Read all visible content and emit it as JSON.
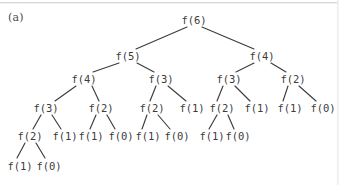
{
  "figure": {
    "panel_label": "(a)",
    "width": 339,
    "height": 185,
    "background_color": "#ffffff",
    "text_color": "#3c3c3c",
    "edge_color": "#3c3c3c"
  },
  "chart_data": {
    "type": "diagram",
    "diagram_kind": "recursion-tree",
    "title": "(a)",
    "root_label": "f(6)",
    "nodes": [
      {
        "id": "n0",
        "label": "f(6)",
        "level": 0,
        "x": 194,
        "y": 20
      },
      {
        "id": "n1",
        "label": "f(5)",
        "level": 1,
        "x": 128,
        "y": 56
      },
      {
        "id": "n2",
        "label": "f(4)",
        "level": 1,
        "x": 262,
        "y": 56
      },
      {
        "id": "n3",
        "label": "f(4)",
        "level": 2,
        "x": 84,
        "y": 79
      },
      {
        "id": "n4",
        "label": "f(3)",
        "level": 2,
        "x": 161,
        "y": 79
      },
      {
        "id": "n5",
        "label": "f(3)",
        "level": 2,
        "x": 229,
        "y": 79
      },
      {
        "id": "n6",
        "label": "f(2)",
        "level": 2,
        "x": 293,
        "y": 79
      },
      {
        "id": "n7",
        "label": "f(3)",
        "level": 3,
        "x": 46,
        "y": 108
      },
      {
        "id": "n8",
        "label": "f(2)",
        "level": 3,
        "x": 101,
        "y": 108
      },
      {
        "id": "n9",
        "label": "f(2)",
        "level": 3,
        "x": 152,
        "y": 108
      },
      {
        "id": "n10",
        "label": "f(1)",
        "level": 3,
        "x": 192,
        "y": 108
      },
      {
        "id": "n11",
        "label": "f(2)",
        "level": 3,
        "x": 222,
        "y": 108
      },
      {
        "id": "n12",
        "label": "f(1)",
        "level": 3,
        "x": 257,
        "y": 108
      },
      {
        "id": "n13",
        "label": "f(1)",
        "level": 3,
        "x": 290,
        "y": 108
      },
      {
        "id": "n14",
        "label": "f(0)",
        "level": 3,
        "x": 323,
        "y": 108
      },
      {
        "id": "n15",
        "label": "f(2)",
        "level": 4,
        "x": 30,
        "y": 136
      },
      {
        "id": "n16",
        "label": "f(1)",
        "level": 4,
        "x": 65,
        "y": 136
      },
      {
        "id": "n17",
        "label": "f(1)",
        "level": 4,
        "x": 91,
        "y": 136
      },
      {
        "id": "n18",
        "label": "f(0)",
        "level": 4,
        "x": 121,
        "y": 136
      },
      {
        "id": "n19",
        "label": "f(1)",
        "level": 4,
        "x": 148,
        "y": 136
      },
      {
        "id": "n20",
        "label": "f(0)",
        "level": 4,
        "x": 177,
        "y": 136
      },
      {
        "id": "n21",
        "label": "f(1)",
        "level": 4,
        "x": 212,
        "y": 136
      },
      {
        "id": "n22",
        "label": "f(0)",
        "level": 4,
        "x": 238,
        "y": 136
      },
      {
        "id": "n23",
        "label": "f(1)",
        "level": 5,
        "x": 20,
        "y": 166
      },
      {
        "id": "n24",
        "label": "f(0)",
        "level": 5,
        "x": 49,
        "y": 166
      }
    ],
    "edges": [
      {
        "from": "n0",
        "to": "n1",
        "x1": 187,
        "y1": 27,
        "x2": 136,
        "y2": 49
      },
      {
        "from": "n0",
        "to": "n2",
        "x1": 202,
        "y1": 27,
        "x2": 254,
        "y2": 49
      },
      {
        "from": "n1",
        "to": "n3",
        "x1": 119,
        "y1": 63,
        "x2": 93,
        "y2": 72
      },
      {
        "from": "n1",
        "to": "n4",
        "x1": 137,
        "y1": 63,
        "x2": 154,
        "y2": 72
      },
      {
        "from": "n2",
        "to": "n5",
        "x1": 254,
        "y1": 63,
        "x2": 236,
        "y2": 72
      },
      {
        "from": "n2",
        "to": "n6",
        "x1": 271,
        "y1": 63,
        "x2": 286,
        "y2": 72
      },
      {
        "from": "n3",
        "to": "n7",
        "x1": 76,
        "y1": 86,
        "x2": 55,
        "y2": 101
      },
      {
        "from": "n3",
        "to": "n8",
        "x1": 92,
        "y1": 86,
        "x2": 99,
        "y2": 101
      },
      {
        "from": "n4",
        "to": "n9",
        "x1": 156,
        "y1": 86,
        "x2": 150,
        "y2": 101
      },
      {
        "from": "n4",
        "to": "n10",
        "x1": 168,
        "y1": 86,
        "x2": 186,
        "y2": 101
      },
      {
        "from": "n5",
        "to": "n11",
        "x1": 223,
        "y1": 86,
        "x2": 217,
        "y2": 101
      },
      {
        "from": "n5",
        "to": "n12",
        "x1": 235,
        "y1": 86,
        "x2": 250,
        "y2": 101
      },
      {
        "from": "n6",
        "to": "n13",
        "x1": 288,
        "y1": 86,
        "x2": 283,
        "y2": 101
      },
      {
        "from": "n6",
        "to": "n14",
        "x1": 299,
        "y1": 86,
        "x2": 316,
        "y2": 101
      },
      {
        "from": "n7",
        "to": "n15",
        "x1": 41,
        "y1": 115,
        "x2": 33,
        "y2": 129
      },
      {
        "from": "n7",
        "to": "n16",
        "x1": 52,
        "y1": 115,
        "x2": 61,
        "y2": 129
      },
      {
        "from": "n8",
        "to": "n17",
        "x1": 96,
        "y1": 115,
        "x2": 90,
        "y2": 129
      },
      {
        "from": "n8",
        "to": "n18",
        "x1": 107,
        "y1": 115,
        "x2": 115,
        "y2": 129
      },
      {
        "from": "n9",
        "to": "n19",
        "x1": 147,
        "y1": 115,
        "x2": 142,
        "y2": 129
      },
      {
        "from": "n9",
        "to": "n20",
        "x1": 158,
        "y1": 115,
        "x2": 170,
        "y2": 129
      },
      {
        "from": "n11",
        "to": "n21",
        "x1": 217,
        "y1": 115,
        "x2": 209,
        "y2": 129
      },
      {
        "from": "n11",
        "to": "n22",
        "x1": 228,
        "y1": 115,
        "x2": 234,
        "y2": 129
      },
      {
        "from": "n15",
        "to": "n23",
        "x1": 25,
        "y1": 143,
        "x2": 17,
        "y2": 158
      },
      {
        "from": "n15",
        "to": "n24",
        "x1": 36,
        "y1": 143,
        "x2": 45,
        "y2": 158
      }
    ]
  }
}
